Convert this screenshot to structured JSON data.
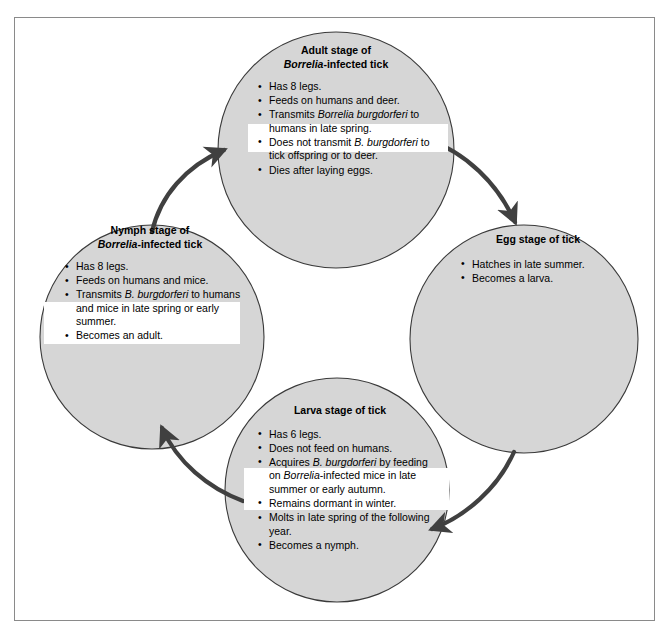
{
  "diagram": {
    "fill_color": "#d6d6d6",
    "stroke_color": "#3a3a3a",
    "arrow_color": "#404040",
    "highlight_color": "#ffffff",
    "frame_color": "#8a8a8a"
  },
  "nodes": {
    "adult": {
      "title_line1": "Adult stage of",
      "title_italic": "Borrelia",
      "title_line2_rest": "-infected tick",
      "bullets": [
        {
          "plain1": "Has 8 legs.",
          "italic": "",
          "plain2": ""
        },
        {
          "plain1": "Feeds on humans and deer.",
          "italic": "",
          "plain2": ""
        },
        {
          "plain1": "Transmits ",
          "italic": "Borrelia burgdorferi",
          "plain2": " to humans in late spring."
        },
        {
          "plain1": "Does not transmit ",
          "italic": "B. burgdorferi",
          "plain2": " to tick offspring or to deer."
        },
        {
          "plain1": "Dies after laying eggs.",
          "italic": "",
          "plain2": ""
        }
      ]
    },
    "nymph": {
      "title_line1": "Nymph stage of",
      "title_italic": "Borrelia",
      "title_line2_rest": "-infected tick",
      "bullets": [
        {
          "plain1": "Has 8 legs.",
          "italic": "",
          "plain2": ""
        },
        {
          "plain1": "Feeds on humans and mice.",
          "italic": "",
          "plain2": ""
        },
        {
          "plain1": "Transmits ",
          "italic": "B. burgdorferi",
          "plain2": " to humans and mice in late spring or early summer."
        },
        {
          "plain1": "Becomes an adult.",
          "italic": "",
          "plain2": ""
        }
      ]
    },
    "egg": {
      "title_line1": "Egg stage of tick",
      "title_italic": "",
      "title_line2_rest": "",
      "bullets": [
        {
          "plain1": "Hatches in late summer.",
          "italic": "",
          "plain2": ""
        },
        {
          "plain1": "Becomes a larva.",
          "italic": "",
          "plain2": ""
        }
      ]
    },
    "larva": {
      "title_line1": "Larva stage of tick",
      "title_italic": "",
      "title_line2_rest": "",
      "bullets": [
        {
          "plain1": "Has 6 legs.",
          "italic": "",
          "plain2": ""
        },
        {
          "plain1": "Does not feed on humans.",
          "italic": "",
          "plain2": ""
        },
        {
          "plain1": "Acquires ",
          "italic": "B. burgdorferi",
          "plain2": " by feeding on "
        },
        {
          "plain1": "Remains dormant in winter.",
          "italic": "",
          "plain2": ""
        },
        {
          "plain1": "Molts in late spring of the following year.",
          "italic": "",
          "plain2": ""
        },
        {
          "plain1": "Becomes a nymph.",
          "italic": "",
          "plain2": ""
        }
      ],
      "acquires_italic2": "Borrelia",
      "acquires_tail": "-infected mice in late summer or early autumn."
    }
  },
  "arrows": [
    {
      "name": "nymph-to-adult",
      "from": "nymph",
      "to": "adult"
    },
    {
      "name": "adult-to-egg",
      "from": "adult",
      "to": "egg"
    },
    {
      "name": "egg-to-larva",
      "from": "egg",
      "to": "larva"
    },
    {
      "name": "larva-to-nymph",
      "from": "larva",
      "to": "nymph"
    }
  ]
}
